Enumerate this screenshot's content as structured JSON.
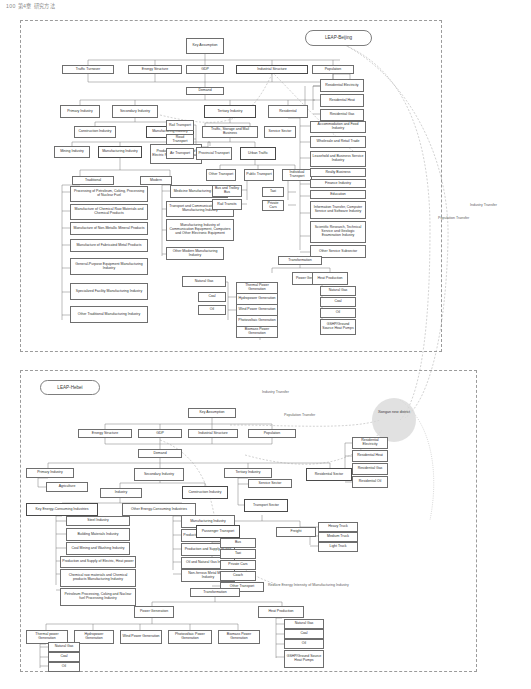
{
  "page": {
    "header_text": "100    第4章 研究方法"
  },
  "panels": [
    {
      "id": "beijing",
      "label": "LEAP-Beijing"
    },
    {
      "id": "hebei",
      "label": "LEAP-Hebei"
    }
  ],
  "cross_labels": {
    "industry_transfer_right": "Industry Transfer",
    "population_transfer_right": "Population Transfer",
    "industry_transfer_mid": "Industry Transfer",
    "population_transfer_mid": "Population Transfer",
    "reduce_energy_intensity": "Reduce Energy Intensity of Manufacturing Industry",
    "circle_note": "Xiongan new district"
  },
  "beijing_nodes": {
    "key_assumption": "Key Assumption",
    "traffic_turnover": "Traffic Turnover",
    "energy_structure": "Energy Structure",
    "gdp": "GDP",
    "industrial_structure": "Industrial Structure",
    "population": "Population",
    "demand": "Demand",
    "primary_industry": "Primary Industry",
    "secondary_industry": "Secondary Industry",
    "tertiary_industry": "Tertiary Industry",
    "residential": "Residential",
    "construction_industry": "Construction Industry",
    "manufacturing_industry": "Manufacturing Industry",
    "mining_industry": "Mining Industry",
    "manufacturing_industry2": "Manufacturing Industry",
    "production_supply_power": "Production and Supply of Electric Power, Gas and Water",
    "traditional": "Traditional",
    "modern": "Modern",
    "trad_items": [
      "Processing of Petroleum, Coking, Processing of Nuclear Fuel",
      "Manufacture of Chemical Raw Materials and Chemical Products",
      "Manufacture of Non-Metallic Mineral Products",
      "Manufacture of Fabricated Metal Products",
      "General-Purpose Equipment Manufacturing Industry",
      "Specialized Facility Manufacturing Industry",
      "Other Traditional Manufacturing Industry"
    ],
    "modern_items": [
      "Medicine Manufacturing Industry",
      "Transport and Communication Facilities Manufacturing Industry",
      "Manufacturing Industry of Communication Equipment, Computers and Other Electronic Equipment",
      "Other Modern Manufacturing Industry"
    ],
    "rail_transport": "Rail Transport",
    "road_transport": "Road Transport",
    "air_transport": "Air Transport",
    "traffic_storage_mail": "Traffic, Storage and Mail Business",
    "service_sector": "Service Sector",
    "provincial_transport": "Provincial Transport",
    "urban_traffic": "Urban Traffic",
    "other_transport": "Other Transport",
    "public_transport": "Public Transport",
    "individual_transport": "Individual Transport",
    "bus_trolley": "Bus and Trolley Bus",
    "rail_transits": "Rail Transits",
    "taxi": "Taxi",
    "private_cars": "Private Cars",
    "residential_items": [
      "Residential Electricity",
      "Residential Heat",
      "Residential Gas"
    ],
    "service_items": [
      "Accommodation and Food Industry",
      "Wholesale and Retail Trade",
      "Leasehold and Business Service Industry",
      "Realty Business",
      "Finance Industry",
      "Education",
      "Information Transfer, Computer Service and Software Industry",
      "Scientific Research, Technical Service and Geologic Examination Industry",
      "Other Service Subsector"
    ],
    "transformation": "Transformation",
    "power_generation": "Power Generation",
    "heat_production": "Heat Production",
    "fuel_natural_gas": "Natural Gas",
    "fuel_coal": "Coal",
    "fuel_oil": "Oil",
    "power_items": [
      "Thermal Power Generation",
      "Hydropower Generation",
      "Wind Power Generation",
      "Photovoltaic Generation",
      "Biomass Power Generation"
    ],
    "heat_items": [
      "Natural Gas",
      "Coal",
      "Oil",
      "GSHP/Ground Source Heat Pumps"
    ]
  },
  "hebei_nodes": {
    "key_assumption": "Key Assumption",
    "energy_structure": "Energy Structure",
    "gdp": "GDP",
    "industrial_structure": "Industrial Structure",
    "population": "Population",
    "demand": "Demand",
    "primary_industry": "Primary Industry",
    "secondary_industry": "Secondary Industry",
    "tertiary_industry": "Tertiary Industry",
    "residential_sector": "Residential Sector",
    "agriculture": "Agriculture",
    "industry": "Industry",
    "construction_industry": "Construction Industry",
    "key_energy_consuming": "Key Energy-Consuming Industries",
    "other_energy_consuming": "Other Energy-Consuming Industries",
    "key_items": [
      "Steel Industry",
      "Building Materials Industry",
      "Coal Mining and Washing Industry",
      "Production and Supply of Electric, Heat power",
      "Chemical raw materials and Chemical products Manufacturing Industry",
      "Petroleum Processing, Coking and Nuclear fuel Processing Industry"
    ],
    "other_items": [
      "Manufacturing Industry",
      "Production and Supply of Water",
      "Production and Supply of Gas",
      "Oil and Natural Gas Industry",
      "Non-ferrous Metal Mining Industry"
    ],
    "service_sector": "Service Sector",
    "transport_sector": "Transport Sector",
    "passenger_transport": "Passenger Transport",
    "freight": "Freight",
    "passenger_items": [
      "Bus",
      "Taxi",
      "Private Cars",
      "Coach",
      "Other Transport"
    ],
    "freight_items": [
      "Heavy Truck",
      "Medium Truck",
      "Light Truck"
    ],
    "residential_items": [
      "Residential Electricity",
      "Residential Heat",
      "Residential Gas",
      "Residential Oil"
    ],
    "transformation": "Transformation",
    "power_generation": "Power Generation",
    "heat_production": "Heat Production",
    "power_items": [
      "Thermal power Generation",
      "Hydropower Generation",
      "Wind Power Generation",
      "Photovoltaic Power Generation",
      "Biomass Power Generation"
    ],
    "heat_items": [
      "Natural Gas",
      "Coal",
      "Oil",
      "GSHP/Ground Source Heat Pumps"
    ]
  }
}
